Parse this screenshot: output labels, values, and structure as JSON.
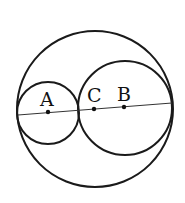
{
  "diagram": {
    "type": "geometry-circles",
    "stroke_color": "#1a1a1a",
    "background": "#ffffff",
    "outer_circle": {
      "cx": 95,
      "cy": 109,
      "r": 78
    },
    "circle_A": {
      "cx": 48,
      "cy": 113,
      "r": 31
    },
    "circle_B": {
      "cx": 125,
      "cy": 108,
      "r": 47
    },
    "line": {
      "x1": 18,
      "y1": 115,
      "x2": 172,
      "y2": 103
    },
    "points": [
      {
        "label": "A",
        "x": 48,
        "y": 112
      },
      {
        "label": "C",
        "x": 94,
        "y": 109
      },
      {
        "label": "B",
        "x": 124,
        "y": 107
      }
    ],
    "labels": {
      "a": "A",
      "c": "C",
      "b": "B"
    }
  }
}
